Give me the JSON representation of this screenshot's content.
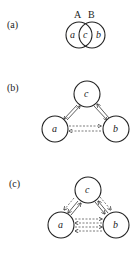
{
  "panels": [
    {
      "id": "a",
      "label": "(a)",
      "set_labels": [
        "A",
        "B"
      ],
      "region_labels": [
        "a",
        "c",
        "b"
      ]
    },
    {
      "id": "b",
      "label": "(b)",
      "nodes": [
        "c",
        "a",
        "b"
      ]
    },
    {
      "id": "c",
      "label": "(c)",
      "nodes": [
        "c",
        "a",
        "b"
      ]
    }
  ]
}
